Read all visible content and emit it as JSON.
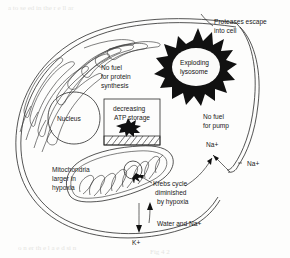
{
  "figure": {
    "type": "biological-cell-diagram",
    "labels": {
      "nucleus": "Nucleus",
      "protein_synthesis": [
        "No fuel",
        "for protein",
        "synthesis"
      ],
      "atp_box": [
        "decreasing",
        "ATP storage"
      ],
      "lysosome": [
        "Exploding",
        "lysosome"
      ],
      "proteases": [
        "Proteases escape",
        "into cell"
      ],
      "pump": [
        "No fuel",
        "for pump"
      ],
      "sodium_outer": "Na+",
      "sodium_inner": "Na+",
      "mitochondria": [
        "Mitochondria",
        "larger in",
        "hypoxia"
      ],
      "krebs": [
        "Krebs cycle",
        "diminished",
        "by hypoxia"
      ],
      "water_sodium": "Water and Na+",
      "potassium": "K+"
    },
    "structures": [
      {
        "name": "cell-membrane",
        "shape": "double-line oval"
      },
      {
        "name": "endoplasmic-reticulum",
        "shape": "looping tubules"
      },
      {
        "name": "nucleus",
        "shape": "rounded circle"
      },
      {
        "name": "atp-storage-box",
        "shape": "rectangle with hatched base and black splat"
      },
      {
        "name": "lysosome",
        "shape": "black spiked star with white center"
      },
      {
        "name": "mitochondrion",
        "shape": "elongated oval with zigzag cristae"
      }
    ],
    "colors": {
      "ink": "#2a2a2a",
      "solid": "#111111",
      "paper": "#fdfdfc"
    }
  }
}
